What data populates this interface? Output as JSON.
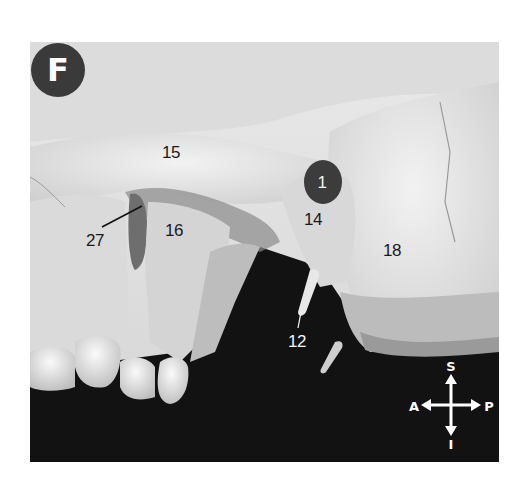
{
  "figure": {
    "panel_letter": "F",
    "colors": {
      "background": "#ffffff",
      "badge_fill": "#3a3a3a",
      "bone_light": "#e6e6e6",
      "bone_mid": "#c8c8c8",
      "shadow": "#111111",
      "label_dark": "#1a1a1a",
      "label_light": "#f2f2f2"
    },
    "labels": [
      {
        "id": "15",
        "text": "15",
        "color": "dark"
      },
      {
        "id": "27",
        "text": "27",
        "color": "dark",
        "has_leader_line": true
      },
      {
        "id": "16",
        "text": "16",
        "color": "dark"
      },
      {
        "id": "1",
        "text": "1",
        "color": "light",
        "on_dark_oval": true
      },
      {
        "id": "14",
        "text": "14",
        "color": "dark"
      },
      {
        "id": "18",
        "text": "18",
        "color": "dark"
      },
      {
        "id": "12",
        "text": "12",
        "color": "light",
        "has_leader_line": true
      }
    ],
    "orientation_compass": {
      "superior": "S",
      "inferior": "I",
      "anterior": "A",
      "posterior": "P"
    }
  }
}
